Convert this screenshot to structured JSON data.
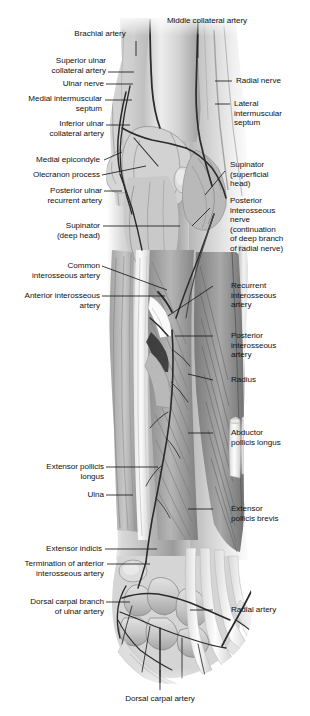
{
  "figure": {
    "type": "anatomical-illustration",
    "style": "grayscale medical illustration",
    "colors": {
      "background": "#ffffff",
      "label_text": "#111111",
      "leader_line": "#1a1a1a",
      "art_light": "#e8e8e8",
      "art_mid": "#a8a8a8",
      "art_dark": "#5a5a5a",
      "art_darkest": "#2e2e2e"
    }
  },
  "labels": {
    "brachial_artery": "Brachial artery",
    "middle_collateral_artery": "Middle collateral artery",
    "superior_ulnar_collateral_artery": "Superior ulnar\ncollateral artery",
    "radial_nerve": "Radial nerve",
    "ulnar_nerve": "Ulnar nerve",
    "medial_intermuscular_septum": "Medial intermuscular\nseptum",
    "lateral_intermuscular_septum": "Lateral\nintermuscular\nseptum",
    "inferior_ulnar_collateral_artery": "Inferior ulnar\ncollateral artery",
    "medial_epicondyle": "Medial epicondyle",
    "supinator_superficial_head": "Supinator\n(superficial\nhead)",
    "olecranon_process": "Olecranon process",
    "posterior_ulnar_recurrent_artery": "Posterior ulnar\nrecurrent artery",
    "posterior_interosseous_nerve": "Posterior\ninterosseous\nnerve\n(continuation\nof deep branch\nof radial nerve)",
    "supinator_deep_head": "Supinator\n(deep head)",
    "common_interosseous_artery": "Common\ninterosseous artery",
    "recurrent_interosseous_artery": "Recurrent\ninterosseous\nartery",
    "anterior_interosseous_artery": "Anterior interosseous\nartery",
    "posterior_interosseous_artery": "Posterior\ninterosseous\nartery",
    "radius": "Radius",
    "abductor_pollicis_longus": "Abductor\npollicis longus",
    "extensor_pollicis_longus": "Extensor pollicis\nlongus",
    "ulna": "Ulna",
    "extensor_pollicis_brevis": "Extensor\npollicis brevis",
    "extensor_indicis": "Extensor indicis",
    "termination_of_anterior_interosseous_artery": "Termination of anterior\ninterosseous artery",
    "dorsal_carpal_branch_of_ulnar_artery": "Dorsal carpal branch\nof ulnar artery",
    "radial_artery": "Radial artery",
    "dorsal_carpal_artery": "Dorsal carpal artery"
  }
}
